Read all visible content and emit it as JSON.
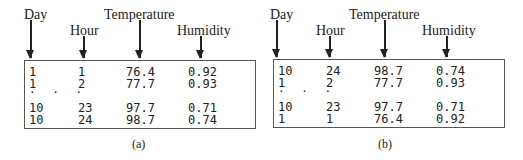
{
  "columns": [
    "Day",
    "Hour",
    "Temperature",
    "Humidity"
  ],
  "panels": [
    {
      "caption": "(a)",
      "rows": [
        [
          "1",
          "1",
          "76.4",
          "0.92"
        ],
        [
          "1",
          "2",
          "77.7",
          "0.93"
        ],
        [
          "10",
          "23",
          "97.7",
          "0.71"
        ],
        [
          "10",
          "24",
          "98.7",
          "0.74"
        ]
      ],
      "ellipsis": ". . ."
    },
    {
      "caption": "(b)",
      "rows": [
        [
          "10",
          "24",
          "98.7",
          "0.74"
        ],
        [
          "1",
          "2",
          "77.7",
          "0.93"
        ],
        [
          "10",
          "23",
          "97.7",
          "0.71"
        ],
        [
          "1",
          "1",
          "76.4",
          "0.92"
        ]
      ],
      "ellipsis": ". . ."
    }
  ]
}
